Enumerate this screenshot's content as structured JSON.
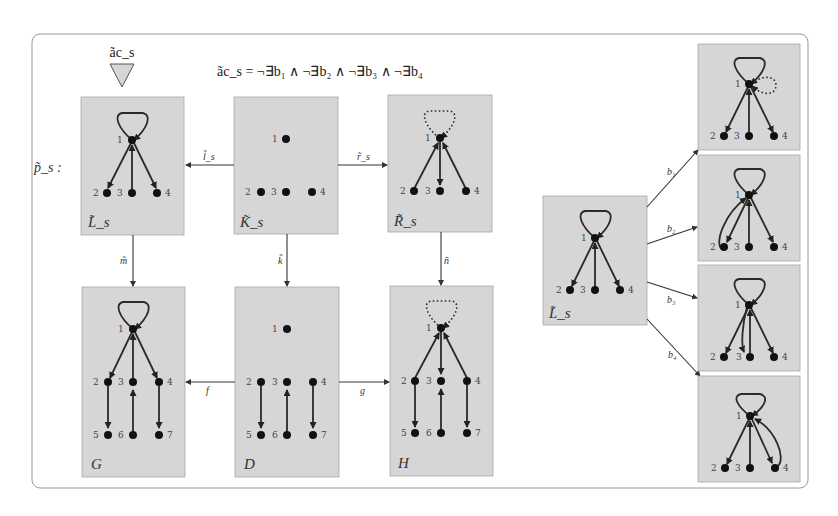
{
  "figure": {
    "application_condition_label": "ãc_s",
    "formula": "ãc_s = ¬∃b₁ ∧ ¬∃b₂ ∧ ¬∃b₃ ∧ ¬∃b₄",
    "rule_label": "p̃_s :"
  },
  "graphs": {
    "Ls": {
      "label": "L̃_s",
      "nodes": [
        "1",
        "2",
        "3",
        "4"
      ]
    },
    "Ks": {
      "label": "K̃_s",
      "nodes": [
        "1",
        "2",
        "3",
        "4"
      ]
    },
    "Rs": {
      "label": "R̃_s",
      "nodes": [
        "1",
        "2",
        "3",
        "4"
      ]
    },
    "G": {
      "label": "G",
      "nodes": [
        "1",
        "2",
        "3",
        "4",
        "5",
        "6",
        "7"
      ]
    },
    "D": {
      "label": "D",
      "nodes": [
        "1",
        "2",
        "3",
        "4",
        "5",
        "6",
        "7"
      ]
    },
    "H": {
      "label": "H",
      "nodes": [
        "1",
        "2",
        "3",
        "4",
        "5",
        "6",
        "7"
      ]
    },
    "Ls2": {
      "label": "L̃_s",
      "nodes": [
        "1",
        "2",
        "3",
        "4"
      ]
    },
    "B1": {
      "nodes": [
        "1",
        "2",
        "3",
        "4"
      ]
    },
    "B2": {
      "nodes": [
        "1",
        "2",
        "3",
        "4"
      ]
    },
    "B3": {
      "nodes": [
        "1",
        "2",
        "3",
        "4"
      ]
    },
    "B4": {
      "nodes": [
        "1",
        "2",
        "3",
        "4"
      ]
    }
  },
  "morphisms": {
    "l": "l̃_s",
    "r": "r̃_s",
    "m": "m̃",
    "k": "k̃",
    "n": "ñ",
    "f": "f",
    "g": "g",
    "b1": "b₁",
    "b2": "b₂",
    "b3": "b₃",
    "b4": "b₄"
  }
}
